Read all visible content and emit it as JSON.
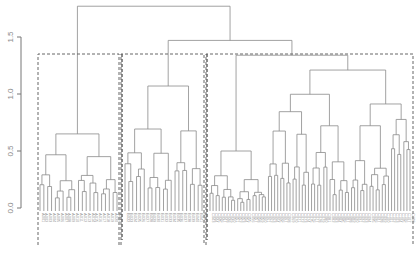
{
  "chart_data": {
    "type": "dendrogram",
    "title": "",
    "xlabel": "",
    "ylabel": "",
    "ylim": [
      0,
      1.8
    ],
    "y_ticks": [
      "0.0",
      "0.5",
      "1.0",
      "1.5"
    ],
    "grid": false,
    "legend": null,
    "leaf_count": 108,
    "merge_heights": {
      "root": 1.77,
      "second_level": 1.47,
      "cluster1_top": 0.65,
      "cluster2_top": 1.07,
      "cluster3_top": 1.34,
      "cluster3_subA": 0.87,
      "cluster3_subB": 1.21,
      "cluster3_subC": 0.88
    },
    "highlighted_clusters": [
      {
        "id": 1,
        "leaves": "1-21",
        "style": "dashed-box"
      },
      {
        "id": 2,
        "leaves": "22-42",
        "style": "dashed-box"
      },
      {
        "id": 3,
        "leaves": "43-108",
        "style": "dashed-box"
      }
    ],
    "leaf_labels_note": "Leaf labels rendered vertically below each leaf; text too small to read at screenshot resolution"
  },
  "axis": {
    "tick_labels": [
      "0.0",
      "0.5",
      "1.0",
      "1.5"
    ]
  }
}
